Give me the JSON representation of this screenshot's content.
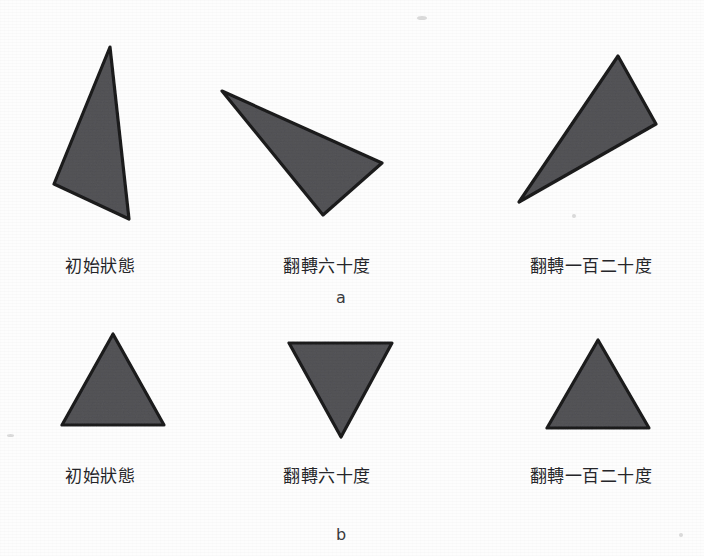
{
  "figure": {
    "background_color": "#fdfdfd",
    "shape_fill_color": "#555559",
    "shape_stroke_color": "#1c1c1e",
    "text_color": "#26262a"
  },
  "rows": [
    {
      "row_label": "a",
      "row_label_x": 341,
      "row_label_y": 288,
      "panels": [
        {
          "caption": "初始狀態",
          "caption_x": 100,
          "caption_y": 252,
          "shape_name": "scalene-triangle-initial",
          "points": "110,47 54,184 129,219"
        },
        {
          "caption": "翻轉六十度",
          "caption_x": 327,
          "caption_y": 252,
          "shape_name": "scalene-triangle-rotated-60",
          "points": "222,91 382,163 323,215"
        },
        {
          "caption": "翻轉一百二十度",
          "caption_x": 591,
          "caption_y": 252,
          "shape_name": "scalene-triangle-rotated-120",
          "points": "618,56 656,124 519,202"
        }
      ]
    },
    {
      "row_label": "b",
      "row_label_x": 341,
      "row_label_y": 525,
      "panels": [
        {
          "caption": "初始狀態",
          "caption_x": 100,
          "caption_y": 462,
          "shape_name": "equilateral-triangle-initial",
          "points": "113,334 62,425 164,425"
        },
        {
          "caption": "翻轉六十度",
          "caption_x": 327,
          "caption_y": 462,
          "shape_name": "equilateral-triangle-rotated-60",
          "points": "289,343 392,343 341,437"
        },
        {
          "caption": "翻轉一百二十度",
          "caption_x": 591,
          "caption_y": 462,
          "shape_name": "equilateral-triangle-rotated-120",
          "points": "598,340 547,428 649,428"
        }
      ]
    }
  ]
}
